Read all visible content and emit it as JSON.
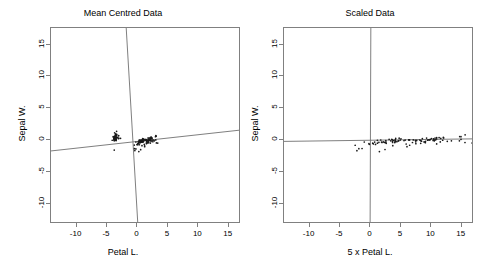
{
  "figure": {
    "background": "#ffffff",
    "axis_color": "#808080",
    "point_color": "#1a1a1a",
    "line_color": "#707070"
  },
  "panels": [
    {
      "key": "mean_centred",
      "title": "Mean Centred Data",
      "xlabel": "Petal L.",
      "ylabel": "Sepal W.",
      "xticks": [
        -10,
        -5,
        0,
        5,
        10,
        15
      ],
      "yticks": [
        -10,
        -5,
        0,
        5,
        10,
        15
      ],
      "xtick_labels": [
        "-10",
        "-5",
        "0",
        "5",
        "10",
        "15"
      ],
      "ytick_labels": [
        "-10",
        "-5",
        "0",
        "5",
        "10",
        "15"
      ],
      "xlim": [
        -14.2,
        17.0
      ],
      "ylim": [
        -13.2,
        17.6
      ]
    },
    {
      "key": "scaled",
      "title": "Scaled Data",
      "xlabel": "5 x Petal L.",
      "ylabel": "Sepal W.",
      "xticks": [
        -10,
        -5,
        0,
        5,
        10,
        15
      ],
      "yticks": [
        -10,
        -5,
        0,
        5,
        10,
        15
      ],
      "xtick_labels": [
        "-10",
        "-5",
        "0",
        "5",
        "10",
        "15"
      ],
      "ytick_labels": [
        "-10",
        "-5",
        "0",
        "5",
        "10",
        "15"
      ],
      "xlim": [
        -14.2,
        17.0
      ],
      "ylim": [
        -13.2,
        17.6
      ]
    }
  ],
  "chart_data": [
    {
      "type": "scatter",
      "panel": "mean_centred",
      "title": "Mean Centred Data",
      "xlabel": "Petal L.",
      "ylabel": "Sepal W.",
      "xlim": [
        -14.2,
        17.0
      ],
      "ylim": [
        -13.2,
        17.6
      ],
      "xticks": [
        -10,
        -5,
        0,
        5,
        10,
        15
      ],
      "yticks": [
        -10,
        -5,
        0,
        5,
        10,
        15
      ],
      "grid": false,
      "legend": "none",
      "annotations": [
        {
          "name": "pc1-axis-line",
          "description": "First principal component axis, shallow positive slope",
          "x": [
            -14.2,
            17.0
          ],
          "y": [
            -1.72,
            1.57
          ]
        },
        {
          "name": "pc2-axis-line",
          "description": "Second principal component axis, steep negative slope",
          "x": [
            -1.85,
            0.06
          ],
          "y": [
            17.6,
            -13.2
          ]
        }
      ],
      "x": [
        -3.758,
        -3.758,
        -3.858,
        -3.658,
        -3.758,
        -3.458,
        -3.758,
        -3.658,
        -3.758,
        -3.658,
        -3.558,
        -3.558,
        -3.758,
        -4.158,
        -3.558,
        -3.458,
        -3.458,
        -3.758,
        -3.058,
        -3.558,
        -3.058,
        -3.558,
        -4.058,
        -3.058,
        -2.858,
        -3.558,
        -3.358,
        -3.658,
        -3.758,
        -3.558,
        -3.558,
        -3.558,
        -3.558,
        -3.758,
        -3.658,
        -3.558,
        -3.958,
        -3.758,
        -3.858,
        -3.658,
        -3.858,
        -3.858,
        -3.858,
        -3.258,
        -3.058,
        -3.658,
        -3.558,
        -3.758,
        -3.658,
        -3.658,
        0.942,
        0.742,
        1.142,
        0.242,
        0.742,
        0.742,
        0.942,
        -0.458,
        0.742,
        0.142,
        -0.258,
        0.242,
        0.242,
        0.942,
        -0.258,
        0.542,
        0.742,
        0.442,
        0.742,
        0.142,
        1.242,
        0.342,
        1.242,
        0.942,
        0.542,
        0.742,
        1.042,
        1.242,
        0.742,
        0.042,
        0.042,
        -0.058,
        0.242,
        1.142,
        0.742,
        0.842,
        0.942,
        0.742,
        0.342,
        0.442,
        0.742,
        0.942,
        0.242,
        -0.458,
        0.442,
        0.442,
        0.442,
        0.642,
        -0.458,
        0.342,
        2.242,
        1.742,
        2.142,
        1.842,
        2.042,
        2.842,
        0.442,
        2.542,
        2.142,
        2.942,
        1.742,
        1.842,
        2.042,
        1.642,
        1.742,
        1.842,
        1.942,
        3.042,
        3.342,
        1.242,
        2.342,
        1.542,
        3.042,
        1.442,
        2.142,
        2.442,
        1.342,
        1.442,
        2.042,
        2.242,
        2.642,
        3.042,
        2.042,
        1.442,
        1.642,
        2.942,
        2.042,
        1.942,
        1.442,
        2.042,
        2.242,
        1.942,
        1.742,
        2.342,
        2.342,
        2.042,
        1.442,
        1.942,
        2.142,
        1.642
      ],
      "y": [
        0.443,
        -0.057,
        0.143,
        0.043,
        0.543,
        0.843,
        0.343,
        0.343,
        -0.157,
        0.043,
        0.643,
        0.343,
        -0.057,
        -0.057,
        0.943,
        1.343,
        0.843,
        0.443,
        0.743,
        0.743,
        0.343,
        0.643,
        0.443,
        0.243,
        0.343,
        -0.057,
        0.343,
        0.443,
        0.343,
        0.143,
        0.043,
        0.343,
        1.043,
        1.143,
        0.043,
        0.143,
        0.443,
        0.343,
        -0.057,
        0.343,
        0.443,
        -1.557,
        0.143,
        0.443,
        0.743,
        -0.057,
        0.743,
        0.143,
        0.643,
        0.243,
        0.143,
        -0.057,
        0.043,
        -0.757,
        -0.257,
        -0.257,
        0.243,
        -1.657,
        -0.157,
        -0.357,
        -1.357,
        -0.057,
        -1.857,
        -0.157,
        -0.257,
        0.043,
        -0.257,
        -0.357,
        -0.857,
        -0.457,
        0.043,
        -0.057,
        -0.857,
        -0.257,
        -0.157,
        -0.057,
        -0.157,
        0.043,
        -0.057,
        -0.657,
        -0.657,
        -0.657,
        -0.357,
        -0.657,
        0.043,
        0.243,
        -0.057,
        -0.357,
        -0.257,
        -0.457,
        -0.357,
        -0.057,
        -0.457,
        -0.757,
        -0.357,
        -0.357,
        -0.357,
        -0.057,
        -1.357,
        -0.357,
        0.243,
        -0.357,
        -0.057,
        -0.157,
        -0.057,
        -0.057,
        -1.557,
        -0.257,
        -0.557,
        0.543,
        0.243,
        -0.357,
        0.043,
        -0.457,
        -0.257,
        0.243,
        0.043,
        0.743,
        -0.457,
        -1.057,
        0.243,
        -0.557,
        -0.457,
        -0.057,
        0.243,
        -0.057,
        -0.057,
        -0.057,
        -0.057,
        -0.257,
        -0.057,
        0.543,
        -0.057,
        -0.257,
        -0.057,
        0.043,
        0.243,
        0.043,
        0.043,
        0.243,
        0.343,
        0.043,
        -0.357,
        0.243,
        0.343,
        0.043,
        -0.457,
        0.043,
        0.343,
        -0.057
      ]
    },
    {
      "type": "scatter",
      "panel": "scaled",
      "title": "Scaled Data",
      "xlabel": "5 x Petal L.",
      "ylabel": "Sepal W.",
      "xlim": [
        -14.2,
        17.0
      ],
      "ylim": [
        -13.2,
        17.6
      ],
      "xticks": [
        -10,
        -5,
        0,
        5,
        10,
        15
      ],
      "yticks": [
        -10,
        -5,
        0,
        5,
        10,
        15
      ],
      "grid": false,
      "legend": "none",
      "x_scale_factor": 5,
      "annotations": [
        {
          "name": "pc1-axis-line",
          "description": "First principal component axis, nearly horizontal",
          "x": [
            -14.2,
            17.0
          ],
          "y": [
            -0.22,
            0.18
          ]
        },
        {
          "name": "pc2-axis-line",
          "description": "Second principal component axis, nearly vertical at x=0",
          "x": [
            0.06,
            -0.06
          ],
          "y": [
            17.6,
            -13.2
          ]
        }
      ]
    }
  ]
}
